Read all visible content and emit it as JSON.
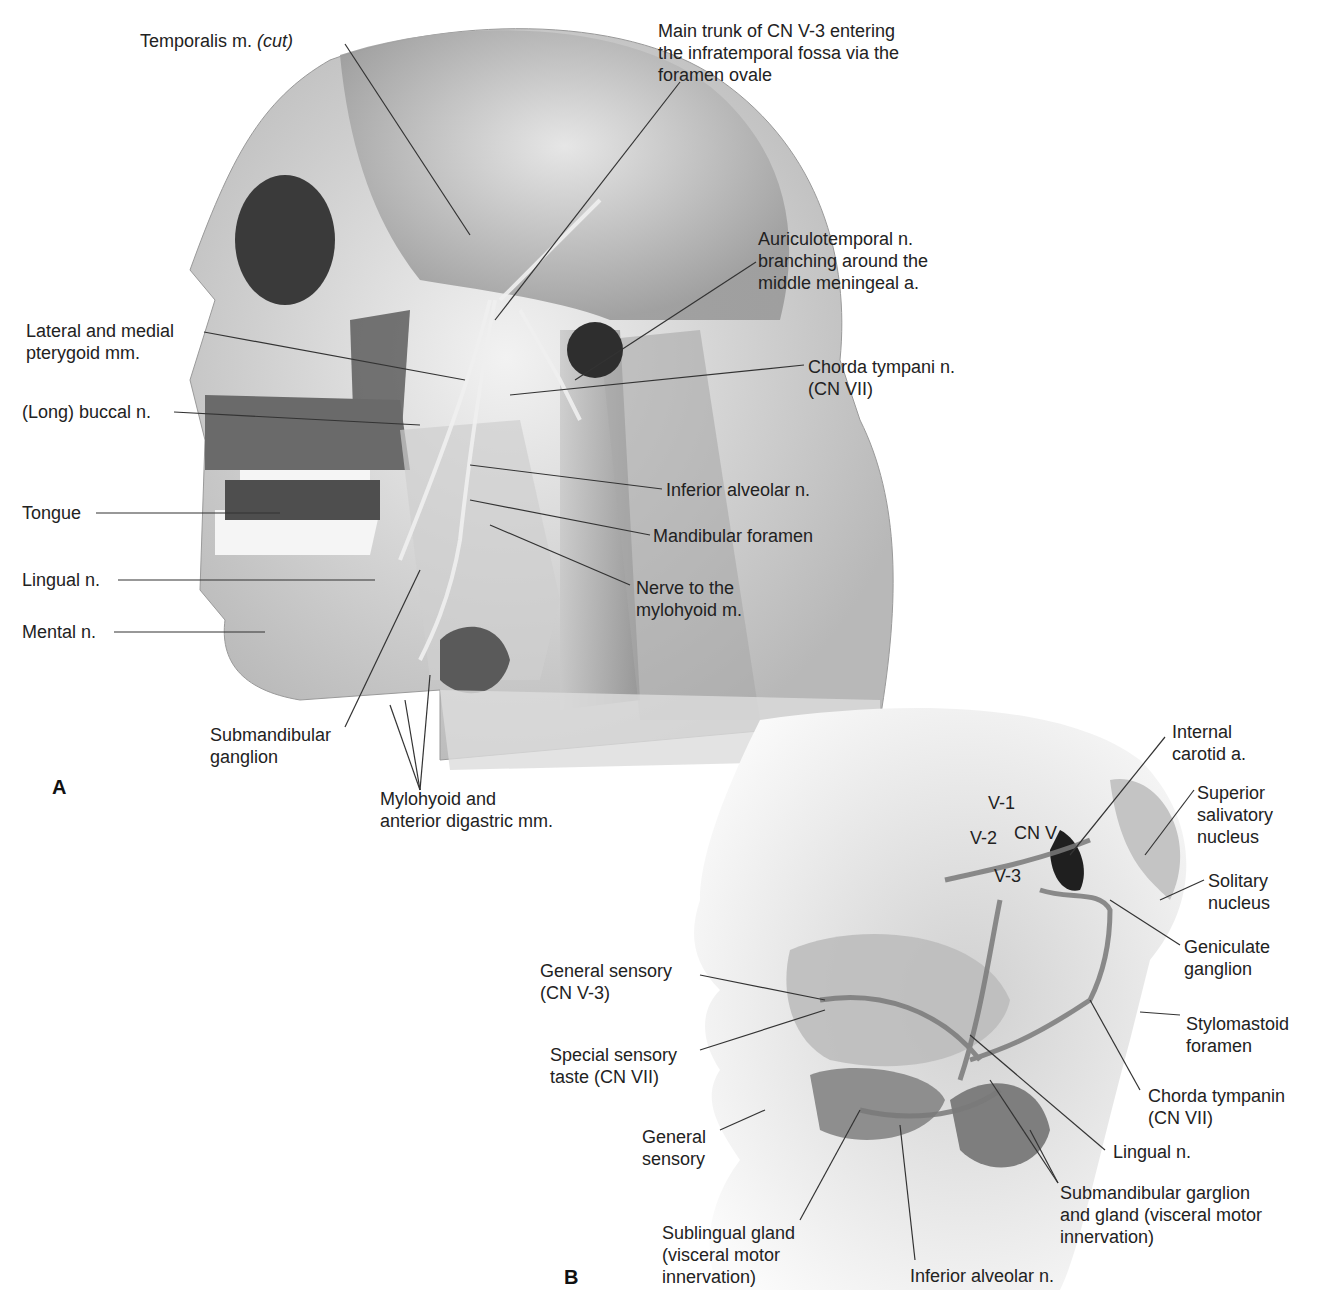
{
  "figure": {
    "panel_a": {
      "letter": "A",
      "labels": {
        "temporalis": "Temporalis m. ",
        "temporalis_cut": "(cut)",
        "main_trunk": "Main trunk of CN V-3 entering\nthe infratemporal fossa via the\nforamen ovale",
        "auriculotemporal": "Auriculotemporal n.\nbranching around the\nmiddle meningeal a.",
        "pterygoid": "Lateral and medial\npterygoid mm.",
        "chorda_tympani": "Chorda tympani n.\n(CN VII)",
        "buccal": "(Long) buccal n.",
        "tongue": "Tongue",
        "inferior_alveolar": "Inferior alveolar n.",
        "mandibular_foramen": "Mandibular foramen",
        "lingual": "Lingual n.",
        "nerve_mylohyoid": "Nerve to the\nmylohyoid m.",
        "mental": "Mental n.",
        "submandibular_ganglion": "Submandibular\nganglion",
        "mylohyoid_digastric": "Mylohyoid and\nanterior digastric mm."
      }
    },
    "panel_b": {
      "letter": "B",
      "labels": {
        "internal_carotid": "Internal\ncarotid a.",
        "v1": "V-1",
        "v2": "V-2",
        "cn_v": "CN V",
        "v3": "V-3",
        "superior_salivatory": "Superior\nsalivatory\nnucleus",
        "solitary": "Solitary\nnucleus",
        "geniculate": "Geniculate\nganglion",
        "general_sensory_v3": "General sensory\n(CN V-3)",
        "stylomastoid": "Stylomastoid\nforamen",
        "special_sensory": "Special sensory\ntaste (CN VII)",
        "chorda_tympanin": "Chorda tympanin\n(CN VII)",
        "general_sensory": "General\nsensory",
        "lingual": "Lingual n.",
        "submandibular_garglion": "Submandibular garglion\nand gland (visceral motor\ninnervation)",
        "sublingual": "Sublingual gland\n(visceral motor\ninnervation)",
        "inferior_alveolar": "Inferior alveolar n."
      }
    }
  }
}
